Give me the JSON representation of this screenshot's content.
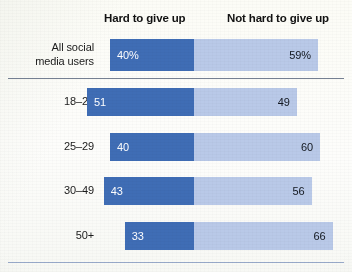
{
  "chart_data": {
    "type": "bar",
    "subtype": "diverging-stacked-bar",
    "title": "",
    "xlabel": "",
    "ylabel": "",
    "legend_position": "top",
    "grid": false,
    "axis_range": [
      0,
      100
    ],
    "categories": [
      "All social\nmedia users",
      "18–24",
      "25–29",
      "30–49",
      "50+"
    ],
    "series": [
      {
        "name": "Hard to give up",
        "color": "#3f6db5",
        "values": [
          40,
          51,
          40,
          43,
          33
        ],
        "labels": [
          "40%",
          "51",
          "40",
          "43",
          "33"
        ]
      },
      {
        "name": "Not hard to give up",
        "color": "#b9c9e8",
        "values": [
          59,
          49,
          60,
          56,
          66
        ],
        "labels": [
          "59%",
          "49",
          "60",
          "56",
          "66"
        ]
      }
    ],
    "rows": [
      {
        "category": "All social\nmedia users",
        "hard_value": 40,
        "hard_label": "40%",
        "not_hard_value": 59,
        "not_hard_label": "59%"
      },
      {
        "category": "18–24",
        "hard_value": 51,
        "hard_label": "51",
        "not_hard_value": 49,
        "not_hard_label": "49"
      },
      {
        "category": "25–29",
        "hard_value": 40,
        "hard_label": "40",
        "not_hard_value": 60,
        "not_hard_label": "60"
      },
      {
        "category": "30–49",
        "hard_value": 43,
        "hard_label": "43",
        "not_hard_value": 56,
        "not_hard_label": "56"
      },
      {
        "category": "50+",
        "hard_value": 33,
        "hard_label": "33",
        "not_hard_value": 66,
        "not_hard_label": "66"
      }
    ]
  },
  "header": {
    "hard_label": "Hard to give up",
    "not_hard_label": "Not hard to give up"
  },
  "colors": {
    "hard": "#3f6db5",
    "not_hard": "#b9c9e8",
    "background": "#fdfdfb",
    "text": "#121212",
    "mid_rule": "#5d6a80",
    "bottom_rule": "#8ea2c6"
  }
}
